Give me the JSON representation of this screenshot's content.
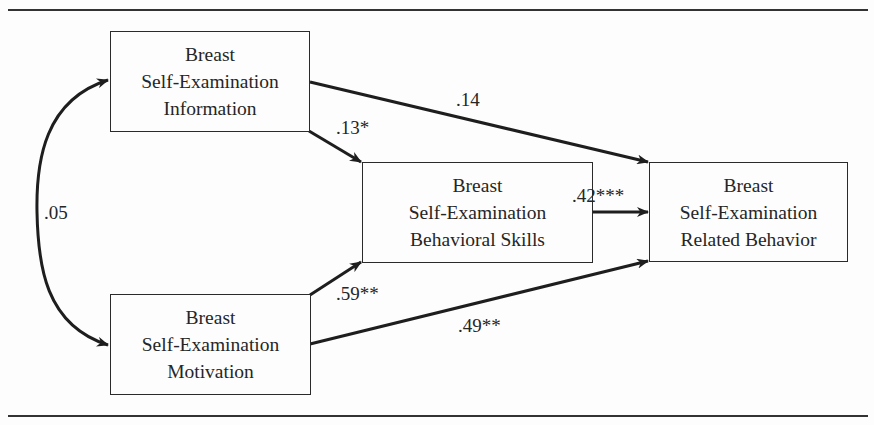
{
  "diagram": {
    "type": "path-model",
    "nodes": {
      "information": {
        "lines": [
          "Breast",
          "Self-Examination",
          "Information"
        ]
      },
      "motivation": {
        "lines": [
          "Breast",
          "Self-Examination",
          "Motivation"
        ]
      },
      "skills": {
        "lines": [
          "Breast",
          "Self-Examination",
          "Behavioral Skills"
        ]
      },
      "behavior": {
        "lines": [
          "Breast",
          "Self-Examination",
          "Related Behavior"
        ]
      }
    },
    "paths": [
      {
        "from": "information",
        "to": "behavior",
        "coefficient": ".14"
      },
      {
        "from": "information",
        "to": "skills",
        "coefficient": ".13*"
      },
      {
        "from": "skills",
        "to": "behavior",
        "coefficient": ".42***"
      },
      {
        "from": "motivation",
        "to": "skills",
        "coefficient": ".59**"
      },
      {
        "from": "motivation",
        "to": "behavior",
        "coefficient": ".49**"
      },
      {
        "from": "information",
        "to": "motivation",
        "coefficient": ".05",
        "kind": "correlation"
      }
    ],
    "colors": {
      "line": "#1e1e1e",
      "text": "#262626",
      "background": "#fdfdfd"
    }
  }
}
